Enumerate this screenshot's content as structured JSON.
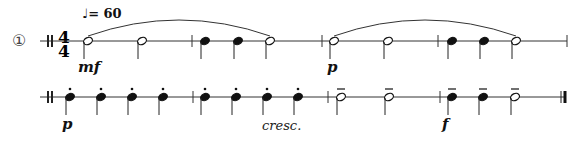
{
  "exercise": {
    "number": "①",
    "tempo": "♩= 60",
    "time_signature": {
      "top": "4",
      "bottom": "4"
    },
    "line1": {
      "dynamics": [
        {
          "text": "mf",
          "x": 78
        },
        {
          "text": "p",
          "x": 327
        }
      ],
      "notes": [
        {
          "type": "half",
          "x": 88
        },
        {
          "type": "half",
          "x": 142
        },
        {
          "type": "quarter",
          "x": 205
        },
        {
          "type": "quarter",
          "x": 238
        },
        {
          "type": "half",
          "x": 270
        },
        {
          "type": "half",
          "x": 334
        },
        {
          "type": "half",
          "x": 388
        },
        {
          "type": "quarter",
          "x": 452
        },
        {
          "type": "quarter",
          "x": 484
        },
        {
          "type": "half",
          "x": 516
        }
      ],
      "barlines": [
        192,
        322,
        438,
        567
      ],
      "slurs": [
        {
          "from": 88,
          "to": 270
        },
        {
          "from": 334,
          "to": 516
        }
      ]
    },
    "line2": {
      "dynamics": [
        {
          "text": "p",
          "x": 62
        },
        {
          "text": "f",
          "x": 442
        }
      ],
      "expression": {
        "text": "cresc.",
        "x": 262
      },
      "notes": [
        {
          "type": "quarter",
          "art": "staccato",
          "x": 70
        },
        {
          "type": "quarter",
          "art": "staccato",
          "x": 101
        },
        {
          "type": "quarter",
          "art": "staccato",
          "x": 132
        },
        {
          "type": "quarter",
          "art": "staccato",
          "x": 163
        },
        {
          "type": "quarter",
          "art": "staccato",
          "x": 205
        },
        {
          "type": "quarter",
          "art": "staccato",
          "x": 236
        },
        {
          "type": "quarter",
          "art": "staccato",
          "x": 267
        },
        {
          "type": "quarter",
          "art": "staccato",
          "x": 298
        },
        {
          "type": "half",
          "art": "tenuto",
          "x": 341
        },
        {
          "type": "half",
          "art": "tenuto",
          "x": 389
        },
        {
          "type": "quarter",
          "art": "tenuto",
          "x": 452
        },
        {
          "type": "quarter",
          "art": "tenuto",
          "x": 483
        },
        {
          "type": "half",
          "art": "tenuto",
          "x": 515
        }
      ],
      "barlines": [
        193,
        328,
        440
      ],
      "final_barline": 565
    }
  }
}
